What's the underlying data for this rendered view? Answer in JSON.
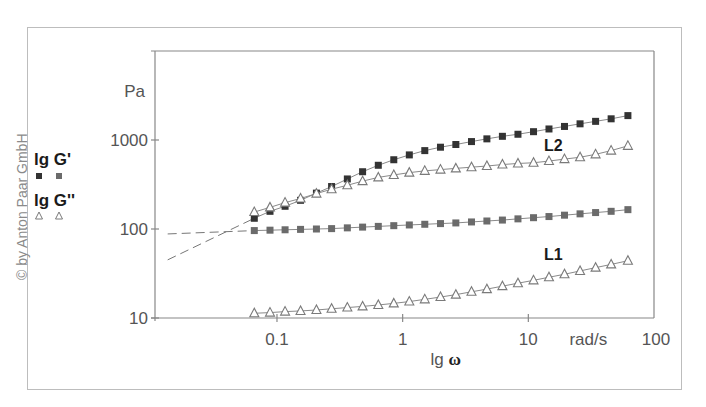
{
  "copyright": "© by Anton Paar GmbH",
  "colors": {
    "square_dark": "#333333",
    "square_light": "#6b6b6b",
    "triangle": "#7a7a7a",
    "axis": "#888888",
    "text": "#555555",
    "frame": "#bdbdbd"
  },
  "legend": {
    "items": [
      {
        "label": "lg G'",
        "marker": "square"
      },
      {
        "label": "lg G''",
        "marker": "triangle"
      }
    ]
  },
  "chart_data": {
    "type": "scatter",
    "title": "",
    "xlabel": "lg ω",
    "xunit": "rad/s",
    "ylabel": "Pa",
    "xscale": "log",
    "yscale": "log",
    "xlim": [
      0.0107,
      100
    ],
    "ylim": [
      10,
      10000
    ],
    "x_ticks": [
      0.1,
      1,
      10,
      100
    ],
    "x_tick_labels": [
      "0.1",
      "1",
      "10",
      "rad/s",
      "100"
    ],
    "y_ticks": [
      10,
      100,
      1000
    ],
    "y_tick_labels": [
      "10",
      "100",
      "1000"
    ],
    "grid": false,
    "legend_position": "left",
    "annotations": [
      {
        "text": "L2",
        "x": 20,
        "y": 620
      },
      {
        "text": "L1",
        "x": 20,
        "y": 40
      }
    ],
    "x": [
      0.066,
      0.088,
      0.116,
      0.154,
      0.206,
      0.272,
      0.363,
      0.48,
      0.64,
      0.85,
      1.13,
      1.5,
      2.0,
      2.65,
      3.53,
      4.68,
      6.22,
      8.27,
      11.0,
      14.6,
      19.4,
      25.8,
      34.3,
      45.6,
      62.0
    ],
    "series": [
      {
        "name": "L2 G'",
        "marker": "square",
        "shade": "dark",
        "values": [
          132,
          158,
          180,
          210,
          253,
          300,
          365,
          440,
          520,
          600,
          680,
          760,
          830,
          890,
          960,
          1030,
          1100,
          1160,
          1240,
          1330,
          1420,
          1520,
          1620,
          1730,
          1880
        ]
      },
      {
        "name": "L2 G''",
        "marker": "triangle",
        "values": [
          155,
          175,
          198,
          220,
          250,
          280,
          310,
          345,
          380,
          405,
          430,
          450,
          465,
          480,
          495,
          510,
          530,
          545,
          555,
          580,
          610,
          640,
          690,
          760,
          860
        ]
      },
      {
        "name": "L1 G'",
        "marker": "square",
        "shade": "light",
        "values": [
          96,
          97,
          98,
          99,
          100,
          101,
          103,
          105,
          107,
          109,
          111,
          113,
          115,
          117,
          120,
          123,
          126,
          130,
          134,
          138,
          143,
          148,
          153,
          158,
          165
        ]
      },
      {
        "name": "L1 G''",
        "marker": "triangle",
        "values": [
          11.3,
          11.5,
          11.8,
          12.0,
          12.3,
          12.7,
          13.1,
          13.5,
          14.0,
          14.6,
          15.3,
          16.2,
          17.2,
          18.3,
          19.7,
          21.1,
          22.8,
          24.6,
          26.5,
          28.7,
          31.0,
          33.8,
          36.8,
          40.0,
          44.0
        ]
      }
    ],
    "extrapolations": [
      {
        "name": "L1 G' extrapolation",
        "style": "dashed",
        "from": [
          0.0135,
          88
        ],
        "to": [
          0.066,
          96
        ]
      },
      {
        "name": "L2 G' extrapolation",
        "style": "dashed",
        "from": [
          0.0135,
          45
        ],
        "to": [
          0.066,
          132
        ]
      }
    ]
  }
}
